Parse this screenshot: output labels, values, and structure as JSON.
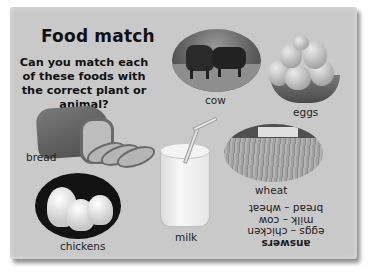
{
  "page": {
    "title": "Food match",
    "question": "Can you match each of these foods with the correct plant or animal?"
  },
  "items": {
    "cow": {
      "label": "cow",
      "image": "cow-photo"
    },
    "eggs": {
      "label": "eggs",
      "image": "eggs-in-basket-photo"
    },
    "bread": {
      "label": "bread",
      "image": "bread-loaf-photo"
    },
    "wheat": {
      "label": "wheat",
      "image": "wheat-field-photo"
    },
    "chickens": {
      "label": "chickens",
      "image": "chickens-photo"
    },
    "milk": {
      "label": "milk",
      "image": "glass-of-milk-photo"
    }
  },
  "answers": {
    "title": "answers",
    "lines": [
      "eggs – chicken",
      "milk – cow",
      "bread – wheat"
    ],
    "orientation": "upside-down"
  },
  "colors": {
    "panel_bg": "#c9c9c9",
    "page_bg": "#ffffff",
    "text": "#1a1a1a"
  }
}
